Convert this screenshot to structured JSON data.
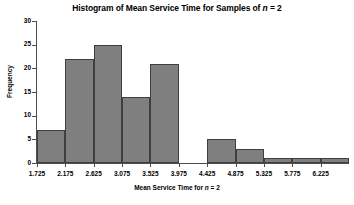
{
  "chart_data": {
    "type": "bar",
    "title": "Histogram of Mean Service Time for Samples of n = 2",
    "title_prefix": "Histogram of Mean Service Time for Samples of ",
    "title_italic": "n",
    "title_suffix": " = 2",
    "xlabel": "Mean Service Time for n = 2",
    "xlabel_prefix": "Mean Service Time for ",
    "xlabel_italic": "n",
    "xlabel_suffix": " = 2",
    "ylabel": "Frequency",
    "categories": [
      "1.725",
      "2.175",
      "2.625",
      "3.075",
      "3.525",
      "3.975",
      "4.425",
      "4.875",
      "5.325",
      "5.775",
      "6.225"
    ],
    "values": [
      7,
      22,
      25,
      14,
      21,
      0,
      5,
      3,
      1,
      1,
      1
    ],
    "xtick_labels": [
      "1.725",
      "2.175",
      "2.625",
      "3.075",
      "3.525",
      "3.975",
      "4.425",
      "4.875",
      "5.325",
      "5.775",
      "6.225"
    ],
    "ytick_labels": [
      "0",
      "5",
      "10",
      "15",
      "20",
      "25",
      "30"
    ],
    "ytick_values": [
      0,
      5,
      10,
      15,
      20,
      25,
      30
    ],
    "ylim": [
      0,
      30
    ],
    "xlim": [
      1.5,
      6.45
    ],
    "bin_width": 0.45,
    "grid": false,
    "legend": false,
    "bar_fill_color": "#7f7f7f",
    "bar_edge_color": "#3f3f3f",
    "axis_color": "#4d4d4d",
    "background_color": "#ffffff"
  }
}
